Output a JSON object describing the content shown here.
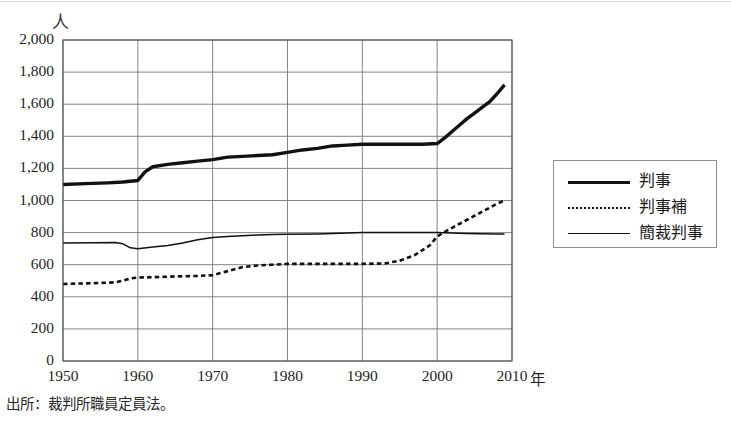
{
  "figure": {
    "unit_label": "人",
    "x_unit_suffix": "年",
    "source_note": "出所：裁判所職員定員法。"
  },
  "legend": {
    "position": "right",
    "items": [
      {
        "label": "判事",
        "style": "thick-solid",
        "color": "#111111"
      },
      {
        "label": "判事補",
        "style": "dashed",
        "color": "#111111"
      },
      {
        "label": "簡裁判事",
        "style": "thin-solid",
        "color": "#111111"
      }
    ]
  },
  "chart_data": {
    "type": "line",
    "title": "",
    "subtitle": "",
    "xlabel": "年",
    "ylabel": "人",
    "xlim": [
      1950,
      2010
    ],
    "ylim": [
      0,
      2000
    ],
    "grid": true,
    "x_ticks": [
      1950,
      1960,
      1970,
      1980,
      1990,
      2000,
      2010
    ],
    "y_ticks": [
      0,
      200,
      400,
      600,
      800,
      1000,
      1200,
      1400,
      1600,
      1800,
      2000
    ],
    "y_tick_labels": [
      "0",
      "200",
      "400",
      "600",
      "800",
      "1,000",
      "1,200",
      "1,400",
      "1,600",
      "1,800",
      "2,000"
    ],
    "x_tick_labels": [
      "1950",
      "1960",
      "1970",
      "1980",
      "1990",
      "2000",
      "2010"
    ],
    "legend_position": "right-outside",
    "series": [
      {
        "name": "判事",
        "style": "thick-solid",
        "color": "#111111",
        "x": [
          1950,
          1953,
          1956,
          1958,
          1959,
          1960,
          1961,
          1962,
          1964,
          1966,
          1968,
          1970,
          1972,
          1974,
          1976,
          1978,
          1980,
          1982,
          1984,
          1986,
          1988,
          1990,
          1994,
          1998,
          2000,
          2001,
          2002,
          2003,
          2004,
          2005,
          2006,
          2007,
          2008,
          2009
        ],
        "values": [
          1100,
          1105,
          1110,
          1115,
          1120,
          1125,
          1180,
          1210,
          1225,
          1235,
          1245,
          1255,
          1270,
          1275,
          1280,
          1285,
          1300,
          1315,
          1325,
          1340,
          1345,
          1350,
          1350,
          1350,
          1355,
          1390,
          1430,
          1470,
          1510,
          1545,
          1580,
          1615,
          1665,
          1720
        ]
      },
      {
        "name": "判事補",
        "style": "dashed",
        "color": "#111111",
        "x": [
          1950,
          1954,
          1957,
          1958,
          1959,
          1960,
          1962,
          1964,
          1966,
          1968,
          1970,
          1972,
          1974,
          1976,
          1978,
          1980,
          1984,
          1988,
          1990,
          1993,
          1995,
          1997,
          1999,
          2000,
          2001,
          2002,
          2003,
          2004,
          2005,
          2006,
          2007,
          2008,
          2009
        ],
        "values": [
          480,
          485,
          490,
          500,
          515,
          520,
          522,
          525,
          528,
          530,
          535,
          560,
          585,
          595,
          600,
          605,
          605,
          605,
          605,
          608,
          625,
          660,
          720,
          775,
          805,
          830,
          855,
          880,
          905,
          930,
          955,
          980,
          1000
        ]
      },
      {
        "name": "簡裁判事",
        "style": "thin-solid",
        "color": "#111111",
        "x": [
          1950,
          1954,
          1957,
          1958,
          1959,
          1960,
          1962,
          1964,
          1966,
          1968,
          1970,
          1972,
          1974,
          1976,
          1978,
          1980,
          1984,
          1986,
          1988,
          1990,
          1995,
          2000,
          2002,
          2004,
          2006,
          2008,
          2009
        ],
        "values": [
          735,
          737,
          738,
          730,
          705,
          700,
          710,
          720,
          735,
          755,
          770,
          775,
          780,
          785,
          788,
          790,
          792,
          795,
          798,
          800,
          800,
          800,
          798,
          795,
          793,
          792,
          792
        ]
      }
    ]
  }
}
